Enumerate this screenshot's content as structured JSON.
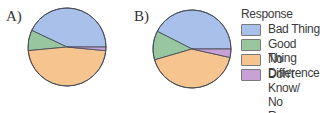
{
  "chart_data": [
    {
      "type": "pie",
      "panel_label": "A)",
      "categories": [
        "Bad Thing",
        "Good Thing",
        "No Difference",
        "Don't Know/ No Response"
      ],
      "values": [
        43,
        8.5,
        47,
        1.5
      ],
      "colors": [
        "#a9c1ea",
        "#98c69f",
        "#f6c48f",
        "#c8a2d6"
      ]
    },
    {
      "type": "pie",
      "panel_label": "B)",
      "categories": [
        "Bad Thing",
        "Good Thing",
        "No Difference",
        "Don't Know/ No Response"
      ],
      "values": [
        42.5,
        12,
        42,
        3.5
      ],
      "colors": [
        "#a9c1ea",
        "#98c69f",
        "#f6c48f",
        "#c8a2d6"
      ]
    }
  ],
  "legend": {
    "title": "Response",
    "items": [
      {
        "label": "Bad Thing",
        "color": "#a9c1ea"
      },
      {
        "label": "Good Thing",
        "color": "#98c69f"
      },
      {
        "label": "No Difference",
        "color": "#f6c48f"
      },
      {
        "label": "Don't Know/",
        "label2": "No Response",
        "color": "#c8a2d6"
      }
    ]
  }
}
